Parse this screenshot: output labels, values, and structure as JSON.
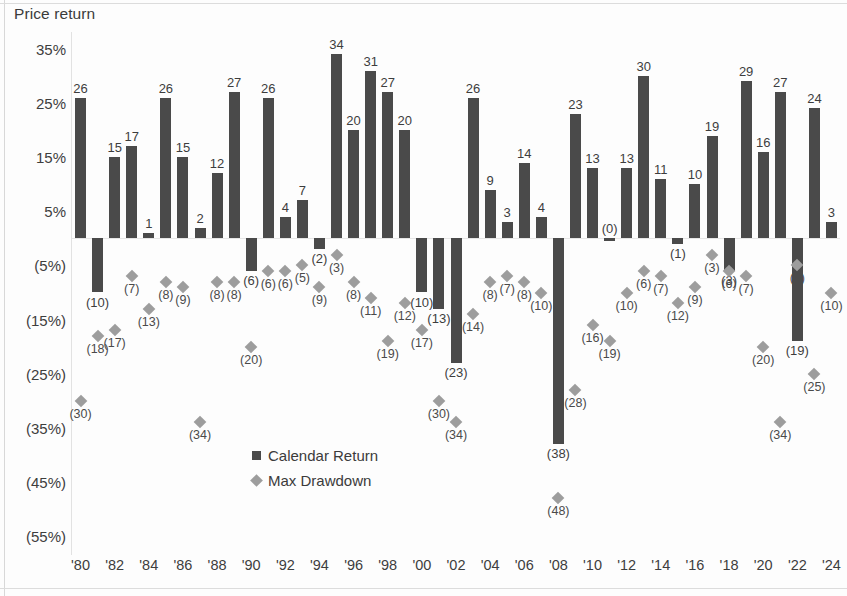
{
  "chart_data": {
    "type": "bar",
    "title": "Price return",
    "xlabel": "",
    "ylabel": "Price return",
    "ylim": [
      -60,
      40
    ],
    "grid": false,
    "legend_position": "center-left-inside",
    "x": [
      "1980",
      "1981",
      "1982",
      "1983",
      "1984",
      "1985",
      "1986",
      "1987",
      "1988",
      "1989",
      "1990",
      "1991",
      "1992",
      "1993",
      "1994",
      "1995",
      "1996",
      "1997",
      "1998",
      "1999",
      "2000",
      "2001",
      "2002",
      "2003",
      "2004",
      "2005",
      "2006",
      "2007",
      "2008",
      "2009",
      "2010",
      "2011",
      "2012",
      "2013",
      "2014",
      "2015",
      "2016",
      "2017",
      "2018",
      "2019",
      "2020",
      "2021",
      "2022",
      "2023",
      "2024"
    ],
    "tick_labels": [
      "'80",
      "'82",
      "'84",
      "'86",
      "'88",
      "'90",
      "'92",
      "'94",
      "'96",
      "'98",
      "'00",
      "'02",
      "'04",
      "'06",
      "'08",
      "'10",
      "'12",
      "'14",
      "'16",
      "'18",
      "'20",
      "'22",
      "'24"
    ],
    "tick_years": [
      "1980",
      "1982",
      "1984",
      "1986",
      "1988",
      "1990",
      "1992",
      "1994",
      "1996",
      "1998",
      "2000",
      "2002",
      "2004",
      "2006",
      "2008",
      "2010",
      "2012",
      "2014",
      "2016",
      "2018",
      "2020",
      "2022",
      "2024"
    ],
    "ytick_labels": [
      "35%",
      "25%",
      "15%",
      "5%",
      "(5%)",
      "(15%)",
      "(25%)",
      "(35%)",
      "(45%)",
      "(55%)"
    ],
    "ytick_values": [
      35,
      25,
      15,
      5,
      -5,
      -15,
      -25,
      -35,
      -45,
      -55
    ],
    "series": [
      {
        "name": "Calendar Return",
        "marker": "square",
        "color": "#4a4a4a",
        "values": [
          26,
          -10,
          15,
          17,
          1,
          26,
          15,
          2,
          12,
          27,
          -6,
          26,
          4,
          7,
          -2,
          34,
          20,
          31,
          27,
          20,
          -10,
          -13,
          -23,
          26,
          9,
          3,
          14,
          4,
          -38,
          23,
          13,
          0,
          13,
          30,
          11,
          -1,
          10,
          19,
          -6,
          29,
          16,
          27,
          -19,
          24,
          3
        ],
        "labels": [
          "26",
          "(10)",
          "15",
          "17",
          "1",
          "26",
          "15",
          "2",
          "12",
          "27",
          "(6)",
          "26",
          "4",
          "7",
          "(2)",
          "34",
          "20",
          "31",
          "27",
          "20",
          "(10)",
          "(13)",
          "(23)",
          "26",
          "9",
          "3",
          "14",
          "4",
          "(38)",
          "23",
          "13",
          "(0)",
          "13",
          "30",
          "11",
          "(1)",
          "10",
          "19",
          "(3)",
          "29",
          "16",
          "27",
          "(19)",
          "24",
          "3"
        ]
      },
      {
        "name": "Max Drawdown",
        "marker": "diamond",
        "color": "#9d9d9d",
        "values": [
          -30,
          -18,
          -17,
          -7,
          -13,
          -8,
          -9,
          -34,
          -8,
          -8,
          -20,
          -6,
          -6,
          -5,
          -9,
          -3,
          -8,
          -11,
          -19,
          -12,
          -17,
          -30,
          -34,
          -14,
          -8,
          -7,
          -8,
          -10,
          -48,
          -28,
          -16,
          -19,
          -10,
          -6,
          -7,
          -12,
          -9,
          -3,
          -6,
          -7,
          -20,
          -34,
          -5,
          -25,
          -10
        ],
        "labels": [
          "(30)",
          "(18)",
          "(17)",
          "(7)",
          "(13)",
          "(8)",
          "(9)",
          "(34)",
          "(8)",
          "(8)",
          "(20)",
          "(6)",
          "(6)",
          "(5)",
          "(9)",
          "(3)",
          "(8)",
          "(11)",
          "(19)",
          "(12)",
          "(17)",
          "(30)",
          "(34)",
          "(14)",
          "(8)",
          "(7)",
          "(8)",
          "(10)",
          "(48)",
          "(28)",
          "(16)",
          "(19)",
          "(10)",
          "(6)",
          "(7)",
          "(12)",
          "(9)",
          "(3)",
          "(6)",
          "(7)",
          "(20)",
          "(34)",
          "(5)",
          "(25)",
          "(10)"
        ]
      }
    ]
  },
  "legend": {
    "items": [
      {
        "label": "Calendar Return",
        "marker": "square"
      },
      {
        "label": "Max Drawdown",
        "marker": "diamond"
      }
    ]
  }
}
